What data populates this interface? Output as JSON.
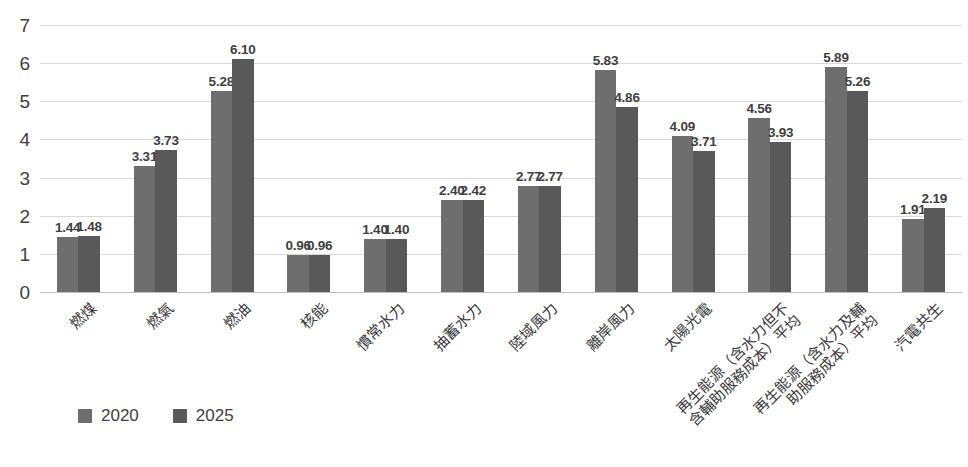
{
  "chart_data": {
    "type": "bar",
    "title": "",
    "xlabel": "",
    "ylabel": "",
    "ylim": [
      0,
      7
    ],
    "yticks": [
      "0",
      "1",
      "2",
      "3",
      "4",
      "5",
      "6",
      "7"
    ],
    "grid": true,
    "legend_position": "bottom-left",
    "categories": [
      "燃煤",
      "燃氣",
      "燃油",
      "核能",
      "慣常水力",
      "抽蓄水力",
      "陸域風力",
      "離岸風力",
      "太陽光電",
      "再生能源（含水力但不含輔助服務成本）平均",
      "再生能源（含水力及輔助服務成本）平均",
      "汽電共生"
    ],
    "category_lines": [
      [
        "燃煤",
        ""
      ],
      [
        "燃氣",
        ""
      ],
      [
        "燃油",
        ""
      ],
      [
        "核能",
        ""
      ],
      [
        "慣常水力",
        ""
      ],
      [
        "抽蓄水力",
        ""
      ],
      [
        "陸域風力",
        ""
      ],
      [
        "離岸風力",
        ""
      ],
      [
        "太陽光電",
        ""
      ],
      [
        "再生能源（含水力但不",
        "含輔助服務成本）平均"
      ],
      [
        "再生能源（含水力及輔",
        "助服務成本）平均"
      ],
      [
        "汽電共生",
        ""
      ]
    ],
    "series": [
      {
        "name": "2020",
        "color": "#6e6e6e",
        "values": [
          1.44,
          3.31,
          5.28,
          0.96,
          1.4,
          2.4,
          2.77,
          5.83,
          4.09,
          4.56,
          5.89,
          1.91
        ],
        "labels": [
          "1.44",
          "3.31",
          "5.28",
          "0.96",
          "1.40",
          "2.40",
          "2.77",
          "5.83",
          "4.09",
          "4.56",
          "5.89",
          "1.91"
        ]
      },
      {
        "name": "2025",
        "color": "#595959",
        "values": [
          1.48,
          3.73,
          6.1,
          0.96,
          1.4,
          2.42,
          2.77,
          4.86,
          3.71,
          3.93,
          5.26,
          2.19
        ],
        "labels": [
          "1.48",
          "3.73",
          "6.10",
          "0.96",
          "1.40",
          "2.42",
          "2.77",
          "4.86",
          "3.71",
          "3.93",
          "5.26",
          "2.19"
        ]
      }
    ]
  },
  "legend": {
    "items": [
      {
        "label": "2020",
        "color": "#6e6e6e"
      },
      {
        "label": "2025",
        "color": "#595959"
      }
    ]
  },
  "colors": {
    "series_2020": "#6e6e6e",
    "series_2025": "#595959",
    "gridline": "#d9d9d9",
    "axis": "#bfbfbf",
    "text": "#3f3f3f",
    "background": "#ffffff"
  }
}
